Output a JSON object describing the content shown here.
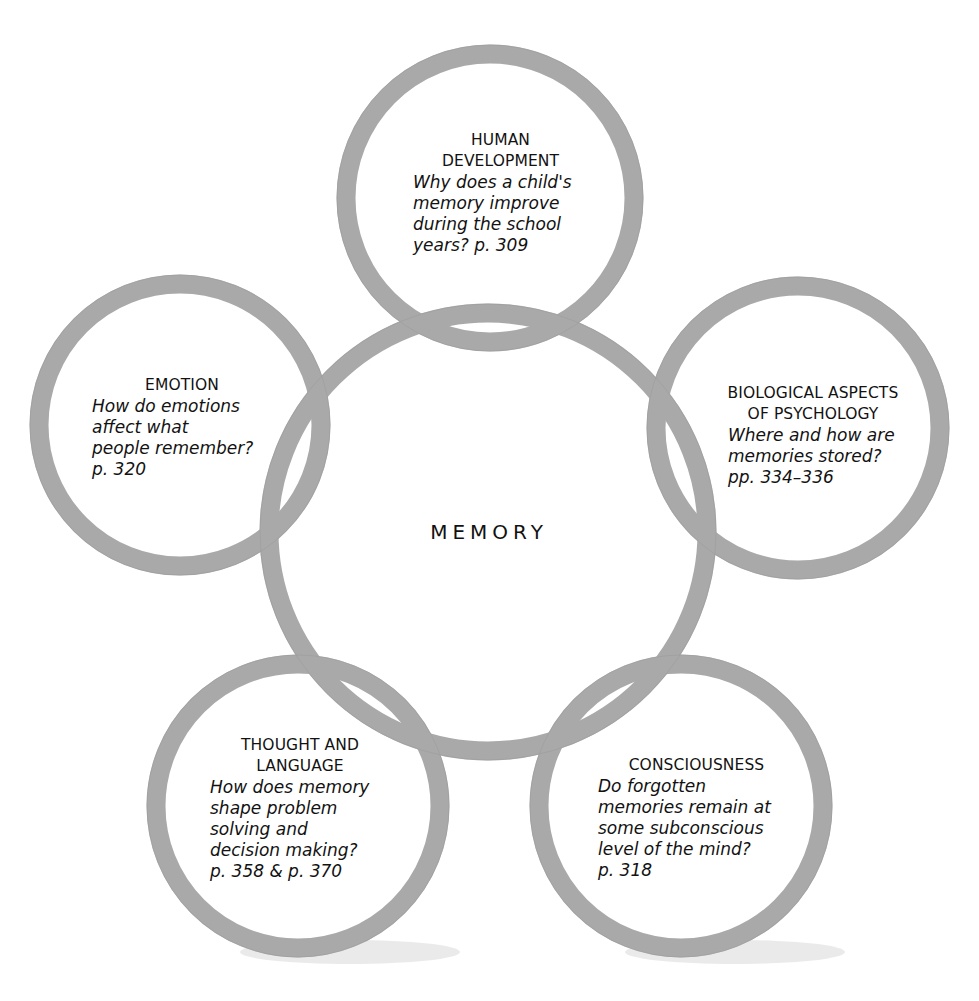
{
  "diagram": {
    "center": {
      "label": "MEMORY"
    },
    "ring_color": "#a9a9a9",
    "nodes": [
      {
        "id": "human-development",
        "title_lines": [
          "HUMAN",
          "DEVELOPMENT"
        ],
        "question_lines": [
          "Why does a child's",
          "memory improve",
          "during the school",
          "years? p. 309"
        ]
      },
      {
        "id": "emotion",
        "title_lines": [
          "EMOTION"
        ],
        "question_lines": [
          "How do emotions",
          "affect what",
          "people remember?",
          "p. 320"
        ]
      },
      {
        "id": "biological-aspects",
        "title_lines": [
          "BIOLOGICAL ASPECTS",
          "OF PSYCHOLOGY"
        ],
        "question_lines": [
          "Where and how are",
          "memories stored?",
          "pp. 334–336"
        ]
      },
      {
        "id": "thought-and-language",
        "title_lines": [
          "THOUGHT AND",
          "LANGUAGE"
        ],
        "question_lines": [
          "How does memory",
          "shape problem",
          "solving and",
          "decision making?",
          "p. 358 & p. 370"
        ]
      },
      {
        "id": "consciousness",
        "title_lines": [
          "CONSCIOUSNESS"
        ],
        "question_lines": [
          "Do forgotten",
          "memories remain at",
          "some subconscious",
          "level of the mind?",
          "p. 318"
        ]
      }
    ]
  }
}
